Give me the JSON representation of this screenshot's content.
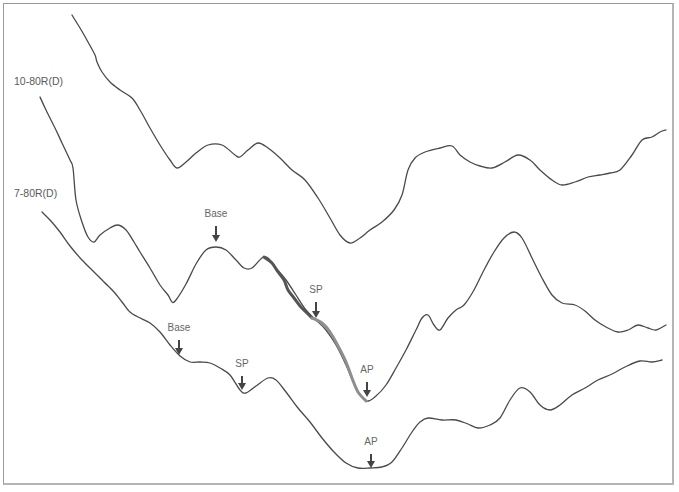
{
  "chart_data": {
    "type": "line",
    "title": "",
    "xlabel": "",
    "ylabel": "",
    "grid": false,
    "legend": "none",
    "trace_labels": [
      {
        "text": "10-80R(D)",
        "x": 14,
        "y": 81
      },
      {
        "text": "7-80R(D)",
        "x": 14,
        "y": 193
      }
    ],
    "series": [
      {
        "name": "top trace",
        "points": [
          [
            72,
            15
          ],
          [
            80,
            28
          ],
          [
            88,
            42
          ],
          [
            95,
            55
          ],
          [
            97,
            62
          ],
          [
            102,
            72
          ],
          [
            110,
            82
          ],
          [
            120,
            90
          ],
          [
            132,
            98
          ],
          [
            140,
            110
          ],
          [
            150,
            128
          ],
          [
            160,
            145
          ],
          [
            170,
            160
          ],
          [
            177,
            168
          ],
          [
            186,
            162
          ],
          [
            196,
            153
          ],
          [
            208,
            145
          ],
          [
            222,
            145
          ],
          [
            235,
            155
          ],
          [
            240,
            157
          ],
          [
            248,
            150
          ],
          [
            258,
            143
          ],
          [
            268,
            148
          ],
          [
            280,
            158
          ],
          [
            292,
            170
          ],
          [
            305,
            180
          ],
          [
            318,
            198
          ],
          [
            330,
            218
          ],
          [
            340,
            235
          ],
          [
            350,
            243
          ],
          [
            360,
            238
          ],
          [
            370,
            230
          ],
          [
            382,
            222
          ],
          [
            394,
            210
          ],
          [
            402,
            195
          ],
          [
            408,
            170
          ],
          [
            415,
            158
          ],
          [
            425,
            152
          ],
          [
            440,
            148
          ],
          [
            452,
            146
          ],
          [
            460,
            155
          ],
          [
            470,
            162
          ],
          [
            480,
            166
          ],
          [
            492,
            168
          ],
          [
            505,
            162
          ],
          [
            518,
            155
          ],
          [
            530,
            160
          ],
          [
            540,
            170
          ],
          [
            552,
            180
          ],
          [
            562,
            185
          ],
          [
            575,
            182
          ],
          [
            588,
            177
          ],
          [
            600,
            175
          ],
          [
            610,
            173
          ],
          [
            620,
            170
          ],
          [
            632,
            155
          ],
          [
            642,
            140
          ],
          [
            652,
            137
          ],
          [
            660,
            132
          ],
          [
            666,
            130
          ]
        ]
      },
      {
        "name": "middle trace",
        "points": [
          [
            40,
            97
          ],
          [
            46,
            110
          ],
          [
            55,
            128
          ],
          [
            62,
            143
          ],
          [
            70,
            160
          ],
          [
            73,
            168
          ],
          [
            76,
            200
          ],
          [
            82,
            222
          ],
          [
            88,
            237
          ],
          [
            94,
            242
          ],
          [
            100,
            235
          ],
          [
            110,
            228
          ],
          [
            118,
            225
          ],
          [
            126,
            230
          ],
          [
            134,
            242
          ],
          [
            140,
            252
          ],
          [
            150,
            268
          ],
          [
            160,
            285
          ],
          [
            168,
            295
          ],
          [
            172,
            302
          ],
          [
            176,
            300
          ],
          [
            186,
            284
          ],
          [
            196,
            264
          ],
          [
            206,
            250
          ],
          [
            216,
            247
          ],
          [
            226,
            250
          ],
          [
            236,
            260
          ],
          [
            244,
            268
          ],
          [
            252,
            268
          ],
          [
            262,
            258
          ],
          [
            268,
            258
          ],
          [
            276,
            268
          ],
          [
            286,
            280
          ],
          [
            296,
            295
          ],
          [
            306,
            310
          ],
          [
            316,
            320
          ],
          [
            326,
            330
          ],
          [
            336,
            345
          ],
          [
            346,
            365
          ],
          [
            356,
            388
          ],
          [
            366,
            401
          ],
          [
            376,
            396
          ],
          [
            386,
            385
          ],
          [
            396,
            368
          ],
          [
            406,
            350
          ],
          [
            416,
            330
          ],
          [
            422,
            318
          ],
          [
            428,
            315
          ],
          [
            434,
            325
          ],
          [
            440,
            330
          ],
          [
            448,
            318
          ],
          [
            456,
            310
          ],
          [
            464,
            305
          ],
          [
            474,
            290
          ],
          [
            484,
            270
          ],
          [
            494,
            252
          ],
          [
            504,
            238
          ],
          [
            514,
            232
          ],
          [
            522,
            238
          ],
          [
            532,
            258
          ],
          [
            542,
            278
          ],
          [
            552,
            295
          ],
          [
            562,
            303
          ],
          [
            575,
            305
          ],
          [
            585,
            311
          ],
          [
            595,
            320
          ],
          [
            606,
            327
          ],
          [
            618,
            332
          ],
          [
            628,
            330
          ],
          [
            638,
            325
          ],
          [
            648,
            328
          ],
          [
            656,
            330
          ],
          [
            666,
            325
          ]
        ]
      },
      {
        "name": "bottom trace",
        "points": [
          [
            42,
            212
          ],
          [
            50,
            220
          ],
          [
            60,
            232
          ],
          [
            70,
            246
          ],
          [
            82,
            260
          ],
          [
            94,
            272
          ],
          [
            104,
            282
          ],
          [
            114,
            292
          ],
          [
            122,
            302
          ],
          [
            130,
            312
          ],
          [
            138,
            317
          ],
          [
            150,
            323
          ],
          [
            160,
            332
          ],
          [
            170,
            345
          ],
          [
            180,
            356
          ],
          [
            190,
            362
          ],
          [
            200,
            362
          ],
          [
            210,
            363
          ],
          [
            220,
            368
          ],
          [
            230,
            375
          ],
          [
            240,
            390
          ],
          [
            246,
            393
          ],
          [
            256,
            386
          ],
          [
            268,
            378
          ],
          [
            276,
            380
          ],
          [
            286,
            392
          ],
          [
            298,
            408
          ],
          [
            310,
            422
          ],
          [
            322,
            438
          ],
          [
            334,
            452
          ],
          [
            346,
            463
          ],
          [
            358,
            468
          ],
          [
            370,
            468
          ],
          [
            382,
            467
          ],
          [
            392,
            462
          ],
          [
            402,
            448
          ],
          [
            412,
            432
          ],
          [
            420,
            422
          ],
          [
            428,
            418
          ],
          [
            442,
            420
          ],
          [
            456,
            420
          ],
          [
            468,
            424
          ],
          [
            478,
            428
          ],
          [
            490,
            425
          ],
          [
            500,
            418
          ],
          [
            510,
            400
          ],
          [
            520,
            388
          ],
          [
            530,
            392
          ],
          [
            540,
            405
          ],
          [
            550,
            410
          ],
          [
            560,
            405
          ],
          [
            572,
            395
          ],
          [
            585,
            388
          ],
          [
            598,
            380
          ],
          [
            612,
            374
          ],
          [
            625,
            367
          ],
          [
            640,
            361
          ],
          [
            652,
            362
          ],
          [
            662,
            360
          ]
        ]
      }
    ],
    "highlighted_segments": [
      {
        "name": "overlay dark",
        "color": "#555555",
        "points": [
          [
            264,
            257
          ],
          [
            272,
            263
          ],
          [
            278,
            272
          ],
          [
            284,
            280
          ],
          [
            288,
            290
          ],
          [
            294,
            298
          ],
          [
            300,
            306
          ],
          [
            306,
            312
          ],
          [
            312,
            318
          ]
        ]
      },
      {
        "name": "overlay light",
        "color": "#8e8e8e",
        "points": [
          [
            312,
            318
          ],
          [
            322,
            323
          ],
          [
            330,
            332
          ],
          [
            338,
            346
          ],
          [
            346,
            362
          ],
          [
            352,
            378
          ],
          [
            358,
            392
          ],
          [
            366,
            401
          ]
        ]
      }
    ],
    "markers": [
      {
        "label": "Base",
        "x": 216,
        "label_y": 214,
        "arrow_top": 226,
        "arrow_len": 16,
        "trace": "middle trace"
      },
      {
        "label": "SP",
        "x": 316,
        "label_y": 290,
        "arrow_top": 302,
        "arrow_len": 16,
        "trace": "middle trace"
      },
      {
        "label": "AP",
        "x": 367,
        "label_y": 370,
        "arrow_top": 382,
        "arrow_len": 15,
        "trace": "middle trace"
      },
      {
        "label": "Base",
        "x": 179,
        "label_y": 328,
        "arrow_top": 340,
        "arrow_len": 15,
        "trace": "bottom trace"
      },
      {
        "label": "SP",
        "x": 242,
        "label_y": 364,
        "arrow_top": 376,
        "arrow_len": 14,
        "trace": "bottom trace"
      },
      {
        "label": "AP",
        "x": 371,
        "label_y": 442,
        "arrow_top": 454,
        "arrow_len": 14,
        "trace": "bottom trace"
      }
    ],
    "colors": {
      "trace": "#4a4a4a",
      "label": "#5a5a5a",
      "arrow": "#444444",
      "frame": "#9a9a9a"
    }
  }
}
